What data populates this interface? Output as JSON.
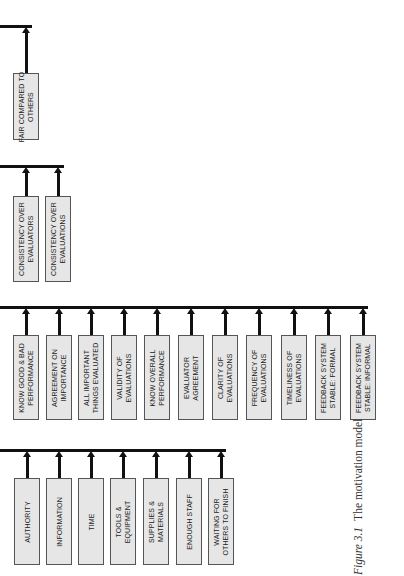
{
  "diagram": {
    "title": "The motivation model",
    "groups": [
      {
        "id": "fairness",
        "line_y": 26,
        "line_x_end": 30,
        "box_top": 73,
        "box_bottom": 140,
        "boxes": [
          {
            "label": "FAIR COMPARED TO\nOTHERS",
            "x": 13
          }
        ]
      },
      {
        "id": "consistency",
        "line_y": 166,
        "line_x_end": 62,
        "box_top": 196,
        "box_bottom": 282,
        "boxes": [
          {
            "label": "CONSISTENCY OVER\nEVALUATORS",
            "x": 13
          },
          {
            "label": "CONSISTENCY OVER\nEVALUATIONS",
            "x": 45
          }
        ]
      },
      {
        "id": "evaluation",
        "line_y": 307,
        "line_x_end": 366,
        "box_top": 335,
        "box_bottom": 420,
        "boxes": [
          {
            "label": "KNOW GOOD & BAD\nPERFORMANCE",
            "x": 13
          },
          {
            "label": "AGREEMENT ON\nIMPORTANCE",
            "x": 46
          },
          {
            "label": "ALL IMPORTANT\nTHINGS EVALUATED",
            "x": 78
          },
          {
            "label": "VALIDITY OF\nEVALUATIONS",
            "x": 111
          },
          {
            "label": "KNOW OVERALL\nPERFORMANCE",
            "x": 144
          },
          {
            "label": "EVALUATOR\nAGREEMENT",
            "x": 178
          },
          {
            "label": "CLARITY OF\nEVALUATIONS",
            "x": 212
          },
          {
            "label": "FREQUENCY OF\nEVALUATIONS",
            "x": 246
          },
          {
            "label": "TIMELINESS OF\nEVALUATIONS",
            "x": 281
          },
          {
            "label": "FEEDBACK SYSTEM\nSTABLE: FORMAL",
            "x": 315
          },
          {
            "label": "FEEDBACK SYSTEM\nSTABLE: INFORMAL",
            "x": 350
          }
        ]
      },
      {
        "id": "resources",
        "line_y": 450,
        "line_x_end": 224,
        "box_top": 478,
        "box_bottom": 565,
        "boxes": [
          {
            "label": "AUTHORITY",
            "x": 14
          },
          {
            "label": "INFORMATION",
            "x": 46
          },
          {
            "label": "TIME",
            "x": 78
          },
          {
            "label": "TOOLS &\nEQUIPMENT",
            "x": 110
          },
          {
            "label": "SUPPLIES &\nMATERIALS",
            "x": 143
          },
          {
            "label": "ENOUGH STAFF",
            "x": 176
          },
          {
            "label": "WAITING FOR\nOTHERS TO FINISH",
            "x": 208
          }
        ]
      }
    ]
  },
  "caption": {
    "figure_label": "Figure 3.1",
    "title": "The motivation model"
  },
  "colors": {
    "line": "#111111",
    "box_fill": "#e6e6e6",
    "box_border": "#555555",
    "text": "#222222"
  }
}
